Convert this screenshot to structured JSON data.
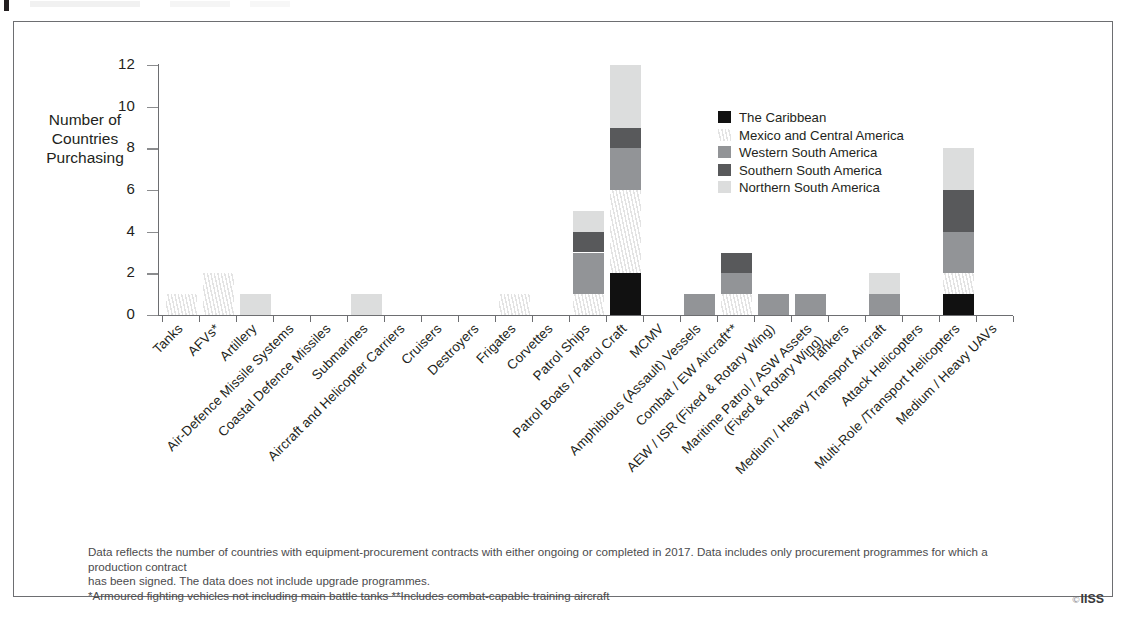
{
  "figure": {
    "ytitle_line1": "Number of Countries",
    "ytitle_line2": "Purchasing",
    "copyright_symbol": "©",
    "copyright_text": "IISS"
  },
  "notes": [
    "Data reflects the number of countries with equipment-procurement contracts with either ongoing or completed in 2017. Data includes only procurement programmes for which a production contract",
    "has been signed. The data does not include upgrade programmes.",
    "*Armoured fighting vehicles not including main battle tanks  **Includes combat-capable training aircraft"
  ],
  "chart_data": {
    "type": "bar",
    "stacked": true,
    "title": "",
    "xlabel": "",
    "ylabel": "Number of Countries Purchasing",
    "ylim": [
      0,
      12
    ],
    "yticks": [
      0,
      2,
      4,
      6,
      8,
      10,
      12
    ],
    "grid": false,
    "legend_position": "inside-right",
    "categories": [
      "Tanks",
      "AFVs*",
      "Artillery",
      "Air-Defence Missile Systems",
      "Coastal Defence Missiles",
      "Submarines",
      "Aircraft and Helicopter Carriers",
      "Cruisers",
      "Destroyers",
      "Frigates",
      "Corvettes",
      "Patrol Ships",
      "Patrol Boats / Patrol Craft",
      "MCMV",
      "Amphibious (Assault) Vessels",
      "Combat / EW Aircraft**",
      "AEW / ISR (Fixed & Rotary Wing)",
      "Maritime Patrol / ASW Assets\n(Fixed & Rotary Wing)",
      "Tankers",
      "Medium / Heavy Transport Aircraft",
      "Attack Helicopters",
      "Multi-Role /Transport Helicopters",
      "Medium / Heavy UAVs"
    ],
    "category_lines": [
      [
        "Tanks"
      ],
      [
        "AFVs*"
      ],
      [
        "Artillery"
      ],
      [
        "Air-Defence Missile Systems"
      ],
      [
        "Coastal Defence Missiles"
      ],
      [
        "Submarines"
      ],
      [
        "Aircraft and Helicopter Carriers"
      ],
      [
        "Cruisers"
      ],
      [
        "Destroyers"
      ],
      [
        "Frigates"
      ],
      [
        "Corvettes"
      ],
      [
        "Patrol Ships"
      ],
      [
        "Patrol Boats / Patrol Craft"
      ],
      [
        "MCMV"
      ],
      [
        "Amphibious (Assault) Vessels"
      ],
      [
        "Combat / EW Aircraft**"
      ],
      [
        "AEW / ISR (Fixed & Rotary Wing)"
      ],
      [
        "Maritime Patrol / ASW Assets",
        "(Fixed & Rotary Wing)"
      ],
      [
        "Tankers"
      ],
      [
        "Medium / Heavy Transport Aircraft"
      ],
      [
        "Attack Helicopters"
      ],
      [
        "Multi-Role /Transport Helicopters"
      ],
      [
        "Medium / Heavy UAVs"
      ]
    ],
    "series": [
      {
        "name": "The Caribbean",
        "color": "#111111",
        "values": [
          0,
          0,
          0,
          0,
          0,
          0,
          0,
          0,
          0,
          0,
          0,
          0,
          2,
          0,
          0,
          0,
          0,
          0,
          0,
          0,
          0,
          1,
          0
        ]
      },
      {
        "name": "Mexico and Central America",
        "color": "#f2f2f2",
        "values": [
          1,
          2,
          0,
          0,
          0,
          0,
          0,
          0,
          0,
          1,
          0,
          1,
          4,
          0,
          0,
          1,
          0,
          0,
          0,
          0,
          0,
          1,
          0
        ]
      },
      {
        "name": "Western South America",
        "color": "#929497",
        "values": [
          0,
          0,
          0,
          0,
          0,
          0,
          0,
          0,
          0,
          0,
          0,
          2,
          2,
          0,
          1,
          1,
          1,
          1,
          0,
          1,
          0,
          2,
          0
        ]
      },
      {
        "name": "Southern South America",
        "color": "#58595b",
        "values": [
          0,
          0,
          0,
          0,
          0,
          0,
          0,
          0,
          0,
          0,
          0,
          1,
          1,
          0,
          0,
          1,
          0,
          0,
          0,
          0,
          0,
          2,
          0
        ]
      },
      {
        "name": "Northern South America",
        "color": "#dcdddd",
        "values": [
          0,
          0,
          1,
          0,
          0,
          1,
          0,
          0,
          0,
          0,
          0,
          1,
          3,
          0,
          0,
          0,
          0,
          0,
          0,
          1,
          0,
          2,
          0
        ]
      }
    ],
    "totals": [
      1,
      2,
      1,
      0,
      0,
      1,
      0,
      0,
      0,
      1,
      0,
      5,
      12,
      0,
      1,
      3,
      1,
      1,
      0,
      2,
      0,
      8,
      0
    ]
  }
}
